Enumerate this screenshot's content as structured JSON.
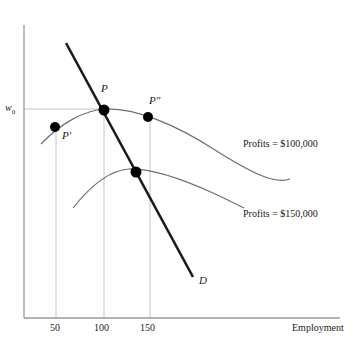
{
  "figure": {
    "type": "economics-diagram",
    "colors": {
      "axis": "#9a9a9a",
      "demand_line": "#1a1a1a",
      "isoprofit_curve": "#6e6e6e",
      "gridline": "#c3c3c3",
      "point": "#000000",
      "text": "#1a1a1a"
    }
  },
  "axes": {
    "x_label": "Employment",
    "y_label_wage": "w",
    "y_label_wage_sub": "0",
    "x_ticks": [
      {
        "label": "50",
        "x": 56
      },
      {
        "label": "100",
        "x": 104
      },
      {
        "label": "150",
        "x": 150
      }
    ]
  },
  "curves": [
    {
      "name": "isoprofit-100000",
      "label": "Profits = $100,000",
      "label_x": 243,
      "label_y": 139
    },
    {
      "name": "isoprofit-150000",
      "label": "Profits = $150,000",
      "label_x": 243,
      "label_y": 209
    },
    {
      "name": "labor-demand",
      "label": "D",
      "label_x": 199,
      "label_y": 275
    }
  ],
  "points": [
    {
      "name": "point-p-prime",
      "label": "P′",
      "cx": 55,
      "cy": 127,
      "label_x": 62,
      "label_y": 130
    },
    {
      "name": "point-p",
      "label": "P",
      "cx": 104,
      "cy": 110,
      "label_x": 101,
      "label_y": 83
    },
    {
      "name": "point-p-double-prime",
      "label": "P″",
      "cx": 148,
      "cy": 117,
      "label_x": 149,
      "label_y": 95
    },
    {
      "name": "point-tangency-lower",
      "label": "",
      "cx": 136,
      "cy": 172,
      "label_x": 0,
      "label_y": 0
    }
  ]
}
